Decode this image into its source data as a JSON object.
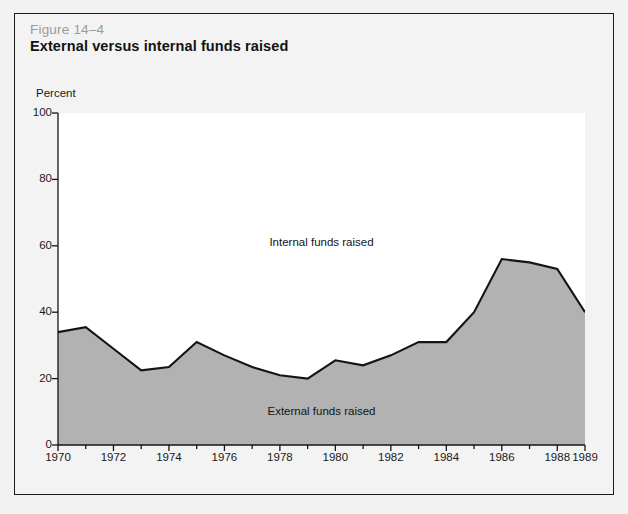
{
  "figure": {
    "number": "Figure 14–4",
    "title": "External versus internal funds raised"
  },
  "colors": {
    "area_fill": "#b2b2b2",
    "line": "#141414",
    "plot_background": "#ffffff",
    "page_background": "#f2f2f2",
    "frame_border": "#1b1b1b",
    "fig_number_text": "#9a9a9a"
  },
  "chart_data": {
    "type": "area",
    "title": "External versus internal funds raised",
    "xlabel": "",
    "ylabel": "Percent",
    "ylim": [
      0,
      100
    ],
    "xlim": [
      1970,
      1989
    ],
    "grid": false,
    "legend_position": "inline-annotation",
    "yticks": [
      0,
      20,
      40,
      60,
      80,
      100
    ],
    "ytick_labels": [
      "0",
      "20",
      "40",
      "60",
      "80",
      "100"
    ],
    "xticks": [
      1970,
      1972,
      1974,
      1976,
      1978,
      1980,
      1982,
      1984,
      1986,
      1988,
      1989
    ],
    "xtick_labels": [
      "1970",
      "1972",
      "1974",
      "1976",
      "1978",
      "1980",
      "1982",
      "1984",
      "1986",
      "1988",
      "1989"
    ],
    "x_minor_ticks": [
      1971,
      1973,
      1975,
      1977,
      1979,
      1981,
      1983,
      1985,
      1987
    ],
    "x": [
      1970,
      1971,
      1972,
      1973,
      1974,
      1975,
      1976,
      1977,
      1978,
      1979,
      1980,
      1981,
      1982,
      1983,
      1984,
      1985,
      1986,
      1987,
      1988,
      1989
    ],
    "series": [
      {
        "name": "External funds raised",
        "values": [
          34,
          35.5,
          29,
          22.5,
          23.5,
          31,
          27,
          23.5,
          21,
          20,
          25.5,
          24,
          27,
          31,
          31,
          40,
          56,
          55,
          53,
          40
        ]
      }
    ],
    "annotations": [
      {
        "text": "Internal funds raised",
        "x": 1980,
        "y": 60
      },
      {
        "text": "External funds raised",
        "x": 1980,
        "y": 10
      }
    ]
  },
  "annotations": {
    "internal": "Internal funds raised",
    "external": "External funds raised"
  }
}
